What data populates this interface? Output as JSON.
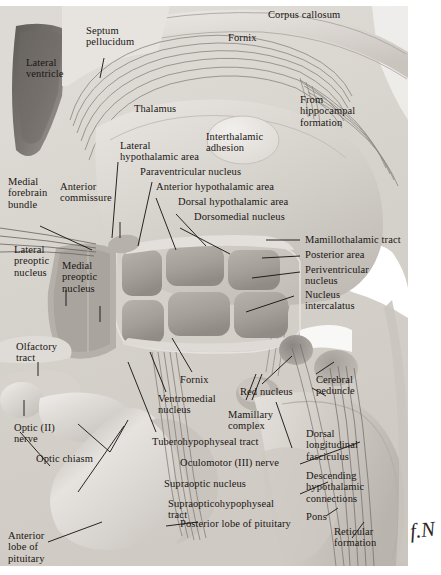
{
  "figure": {
    "kind": "anatomical-illustration",
    "style": "grayscale airbrush medical illustration",
    "signature": "f.N",
    "palette": {
      "paper": "#ffffff",
      "background_tissue": "#d8d4ce",
      "light_tissue": "#e9e6e1",
      "mid_tissue": "#bdb8b2",
      "dark_tissue": "#8f8a85",
      "ventricle_dark": "#6f6a66",
      "nucleus_block": "#a9a39d",
      "fiber_line": "#7d7873",
      "label_text": "#1a1613",
      "leader_line": "#141010"
    }
  },
  "labels": [
    {
      "id": "lateral-ventricle",
      "text": "Lateral\nventricle"
    },
    {
      "id": "septum-pellucidum",
      "text": "Septum\npellucidum"
    },
    {
      "id": "fornix-top",
      "text": "Fornix"
    },
    {
      "id": "corpus-callosum",
      "text": "Corpus callosum"
    },
    {
      "id": "thalamus",
      "text": "Thalamus"
    },
    {
      "id": "from-hippocampal-formation",
      "text": "From\nhippocampal\nformation"
    },
    {
      "id": "interthalamic-adhesion",
      "text": "Interthalamic\nadhesion"
    },
    {
      "id": "lateral-hypothalamic-area",
      "text": "Lateral\nhypothalamic area"
    },
    {
      "id": "paraventricular-nucleus",
      "text": "Paraventricular nucleus"
    },
    {
      "id": "anterior-hypothalamic-area",
      "text": "Anterior hypothalamic area"
    },
    {
      "id": "dorsal-hypothalamic-area",
      "text": "Dorsal hypothalamic area"
    },
    {
      "id": "dorsomedial-nucleus",
      "text": "Dorsomedial nucleus"
    },
    {
      "id": "medial-forebrain-bundle",
      "text": "Medial\nforebrain\nbundle"
    },
    {
      "id": "anterior-commissure",
      "text": "Anterior\ncommissure"
    },
    {
      "id": "mamillothalamic-tract",
      "text": "Mamillothalamic tract"
    },
    {
      "id": "posterior-area",
      "text": "Posterior area"
    },
    {
      "id": "periventricular-nucleus",
      "text": "Periventricular\nnucleus"
    },
    {
      "id": "nucleus-intercalatus",
      "text": "Nucleus\nintercalatus"
    },
    {
      "id": "lateral-preoptic-nucleus",
      "text": "Lateral\npreoptic\nnucleus"
    },
    {
      "id": "medial-preoptic-nucleus",
      "text": "Medial\npreoptic\nnucleus"
    },
    {
      "id": "olfactory-tract",
      "text": "Olfactory\ntract"
    },
    {
      "id": "fornix-lower",
      "text": "Fornix"
    },
    {
      "id": "red-nucleus",
      "text": "Red nucleus"
    },
    {
      "id": "cerebral-peduncle",
      "text": "Cerebral\npeduncle"
    },
    {
      "id": "ventromedial-nucleus",
      "text": "Ventromedial\nnucleus"
    },
    {
      "id": "mamillary-complex",
      "text": "Mamillary\ncomplex"
    },
    {
      "id": "optic-nerve",
      "text": "Optic (II)\nnerve"
    },
    {
      "id": "optic-chiasm",
      "text": "Optic chiasm"
    },
    {
      "id": "tuberohypophyseal-tract",
      "text": "Tuberohypophyseal tract"
    },
    {
      "id": "oculomotor-nerve",
      "text": "Oculomotor (III) nerve"
    },
    {
      "id": "dorsal-longitudinal-fasciculus",
      "text": "Dorsal\nlongitudinal\nfasciculus"
    },
    {
      "id": "descending-hypothalamic-connections",
      "text": "Descending\nhypothalamic\nconnections"
    },
    {
      "id": "supraoptic-nucleus",
      "text": "Supraoptic nucleus"
    },
    {
      "id": "supraopticohypophyseal-tract",
      "text": "Supraopticohypophyseal\ntract"
    },
    {
      "id": "pons",
      "text": "Pons"
    },
    {
      "id": "reticular-formation",
      "text": "Reticular\nformation"
    },
    {
      "id": "posterior-lobe-of-pituitary",
      "text": "Posterior lobe of pituitary"
    },
    {
      "id": "anterior-lobe-of-pituitary",
      "text": "Anterior\nlobe of\npituitary"
    }
  ]
}
